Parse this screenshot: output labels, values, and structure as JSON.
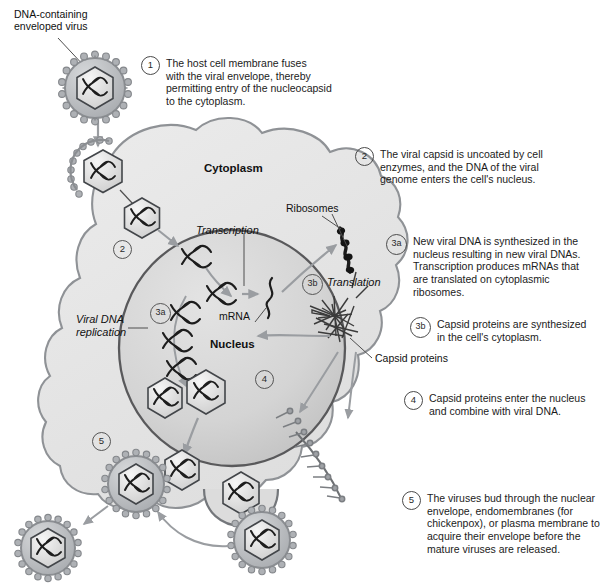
{
  "figure": {
    "colors": {
      "cytoplasm_fill": "#e8e8e8",
      "cytoplasm_stroke": "#8f9296",
      "nucleus_fill": "#d8d8d8",
      "nucleus_stroke": "#59595b",
      "arrow_gray": "#9a9da1",
      "line_dark": "#2b2b2b",
      "virus_envelope": "#b9bcc0",
      "capsid_fill": "#e4e4e4",
      "dna_color": "#1d1d1d",
      "text": "#1b1b1b"
    }
  },
  "labels": {
    "virus_caption": "DNA-containing\nenveloped virus",
    "virus_caption_line1": "DNA-containing",
    "virus_caption_line2": "enveloped virus",
    "cytoplasm": "Cytoplasm",
    "nucleus": "Nucleus",
    "ribosomes": "Ribosomes",
    "transcription": "Transcription",
    "translation": "Translation",
    "mrna": "mRNA",
    "viral_dna_replication_line1": "Viral DNA",
    "viral_dna_replication_line2": "replication",
    "capsid_proteins": "Capsid proteins"
  },
  "inline_markers": {
    "step2_cell": "2",
    "step3a_cell": "3a",
    "step3b_cell": "3b",
    "step4_cell": "4",
    "step5_cell": "5"
  },
  "steps": [
    {
      "number": "1",
      "text": "The host cell membrane fuses with the viral envelope, thereby permitting entry of the nucleocapsid to the cytoplasm.",
      "lines": [
        "The host cell membrane fuses",
        "with the viral envelope, thereby",
        "permitting entry of the nucleocapsid",
        "to the cytoplasm."
      ]
    },
    {
      "number": "2",
      "text": "The viral capsid is uncoated by cell enzymes, and the DNA of the viral genome enters the cell's nucleus.",
      "lines": [
        "The viral capsid is uncoated by cell",
        "enzymes, and the DNA of the viral",
        "genome enters the cell's nucleus."
      ]
    },
    {
      "number": "3a",
      "text": "New viral DNA is synthesized in the nucleus resulting in new viral DNAs. Transcription produces mRNAs that are translated on cytoplasmic ribosomes.",
      "lines": [
        "New viral DNA is synthesized in the",
        "nucleus resulting in new viral DNAs.",
        "Transcription produces mRNAs that",
        "are translated on cytoplasmic",
        "ribosomes."
      ]
    },
    {
      "number": "3b",
      "text": "Capsid proteins are synthesized in the cell's cytoplasm.",
      "lines": [
        "Capsid proteins are synthesized",
        "in the cell's cytoplasm."
      ]
    },
    {
      "number": "4",
      "text": "Capsid proteins enter the nucleus and combine with viral DNA.",
      "lines": [
        "Capsid proteins enter the nucleus",
        "and combine with viral DNA."
      ]
    },
    {
      "number": "5",
      "text": "The viruses bud through the nuclear envelope, endomembranes (for chickenpox), or plasma membrane to acquire their envelope before the mature viruses are released.",
      "lines": [
        "The viruses bud through the nuclear",
        "envelope, endomembranes (for",
        "chickenpox), or plasma membrane to",
        "acquire their envelope before the",
        "mature viruses are released."
      ]
    }
  ]
}
